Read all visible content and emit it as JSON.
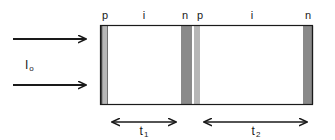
{
  "figure": {
    "type": "device-cross-section-diagram",
    "background_color": "#ffffff",
    "line_color": "#1a1a1a"
  },
  "source": {
    "label_main": "I",
    "label_sub": "o",
    "arrows": [
      {
        "name": "upper-light-arrow",
        "x1": 13,
        "y1": 39,
        "x2": 90,
        "y2": 39
      },
      {
        "name": "lower-light-arrow",
        "x1": 13,
        "y1": 85,
        "x2": 90,
        "y2": 85
      }
    ],
    "label_x": 25,
    "label_y": 60
  },
  "device": {
    "outline": {
      "x": 100,
      "y": 25,
      "width": 213,
      "height": 80
    },
    "colors": {
      "p_layer": "#b7b7b7",
      "i_layer": "#ffffff",
      "n_layer": "#8a8a8a",
      "outline": "#1a1a1a"
    },
    "cells": [
      {
        "name": "cell-1",
        "layers": [
          {
            "type": "p",
            "label": "p",
            "x": 101,
            "width": 7,
            "fill": "#b7b7b7",
            "label_x": 105
          },
          {
            "type": "i",
            "label": "i",
            "x": 108,
            "width": 73,
            "fill": "#ffffff",
            "label_x": 144
          },
          {
            "type": "n",
            "label": "n",
            "x": 181,
            "width": 11,
            "fill": "#8a8a8a",
            "label_x": 184
          }
        ],
        "thickness": {
          "name": "t1",
          "label": "t",
          "sub": "1",
          "x1": 107,
          "x2": 181,
          "y": 122,
          "label_x": 144,
          "label_y": 126
        }
      },
      {
        "name": "cell-2",
        "layers": [
          {
            "type": "p",
            "label": "p",
            "x": 194,
            "width": 6,
            "fill": "#b7b7b7",
            "label_x": 199
          },
          {
            "type": "i",
            "label": "i",
            "x": 200,
            "width": 103,
            "fill": "#ffffff",
            "label_x": 252
          },
          {
            "type": "n",
            "label": "n",
            "x": 303,
            "width": 10,
            "fill": "#8a8a8a",
            "label_x": 307
          }
        ],
        "thickness": {
          "name": "t2",
          "label": "t",
          "sub": "2",
          "x1": 199,
          "x2": 312,
          "y": 122,
          "label_x": 256,
          "label_y": 126
        }
      }
    ],
    "layer_label_y": 10
  }
}
